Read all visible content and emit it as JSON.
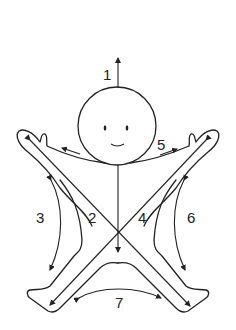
{
  "diagram": {
    "line_color": "#222222",
    "background": "#ffffff",
    "labels": [
      {
        "id": "1",
        "text": "1",
        "meaning": "upward from head"
      },
      {
        "id": "2",
        "text": "2",
        "meaning": "inner left diagonal"
      },
      {
        "id": "3",
        "text": "3",
        "meaning": "outer left side"
      },
      {
        "id": "4",
        "text": "4",
        "meaning": "inner right diagonal"
      },
      {
        "id": "5",
        "text": "5",
        "meaning": "right arm"
      },
      {
        "id": "6",
        "text": "6",
        "meaning": "outer right side"
      },
      {
        "id": "7",
        "text": "7",
        "meaning": "between feet"
      }
    ]
  }
}
